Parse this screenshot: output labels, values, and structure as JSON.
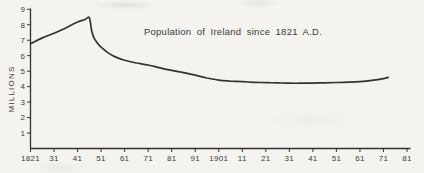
{
  "figure": {
    "title": "Population of Ireland since 1821 A.D.",
    "y_axis_label": "MILLIONS"
  },
  "colors": {
    "background": "#f4f3f0",
    "ink": "#34332f",
    "text": "#3b3a36"
  },
  "chart_data": {
    "type": "line",
    "title": "Population of Ireland since 1821 A.D.",
    "xlabel": "",
    "ylabel": "MILLIONS",
    "y_unit": "millions of people",
    "x_unit": "year",
    "xlim": [
      1821,
      1981
    ],
    "ylim": [
      0,
      9
    ],
    "grid": false,
    "legend": null,
    "y_ticks": [
      1,
      2,
      3,
      4,
      5,
      6,
      7,
      8,
      9
    ],
    "x_ticks": [
      1821,
      1831,
      1841,
      1851,
      1861,
      1871,
      1881,
      1891,
      1901,
      1911,
      1921,
      1931,
      1941,
      1951,
      1961,
      1971,
      1981
    ],
    "x_tick_labels": [
      "1821",
      "31",
      "41",
      "51",
      "61",
      "71",
      "81",
      "91",
      "1901",
      "11",
      "21",
      "31",
      "41",
      "51",
      "61",
      "71",
      "81"
    ],
    "series": [
      {
        "name": "Population of Ireland (millions)",
        "points": [
          [
            1821,
            6.78
          ],
          [
            1826,
            7.15
          ],
          [
            1831,
            7.45
          ],
          [
            1836,
            7.8
          ],
          [
            1841,
            8.18
          ],
          [
            1844,
            8.33
          ],
          [
            1846,
            8.45
          ],
          [
            1847,
            7.6
          ],
          [
            1848,
            7.15
          ],
          [
            1849,
            6.9
          ],
          [
            1851,
            6.55
          ],
          [
            1854,
            6.18
          ],
          [
            1857,
            5.92
          ],
          [
            1861,
            5.7
          ],
          [
            1866,
            5.53
          ],
          [
            1871,
            5.4
          ],
          [
            1876,
            5.22
          ],
          [
            1881,
            5.05
          ],
          [
            1886,
            4.9
          ],
          [
            1891,
            4.74
          ],
          [
            1896,
            4.56
          ],
          [
            1901,
            4.42
          ],
          [
            1906,
            4.36
          ],
          [
            1911,
            4.32
          ],
          [
            1916,
            4.28
          ],
          [
            1921,
            4.26
          ],
          [
            1926,
            4.24
          ],
          [
            1931,
            4.22
          ],
          [
            1936,
            4.22
          ],
          [
            1941,
            4.23
          ],
          [
            1946,
            4.25
          ],
          [
            1951,
            4.27
          ],
          [
            1956,
            4.29
          ],
          [
            1961,
            4.32
          ],
          [
            1966,
            4.4
          ],
          [
            1971,
            4.52
          ],
          [
            1973,
            4.6
          ]
        ]
      }
    ]
  }
}
